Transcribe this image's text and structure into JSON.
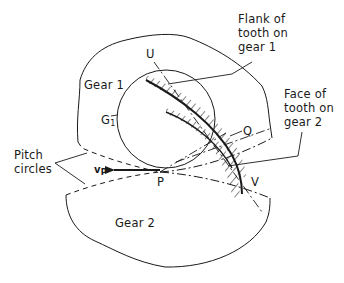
{
  "diagram": {
    "type": "gear-tooth-contact",
    "labels": {
      "gear1": "Gear 1",
      "gear2": "Gear 2",
      "g1_main": "G",
      "g1_sub": "1",
      "point_u": "U",
      "point_q": "Q",
      "point_p": "P",
      "point_v": "V",
      "vp_main": "v",
      "vp_sub": "P",
      "flank_line1": "Flank of",
      "flank_line2": "tooth on",
      "flank_line3": "gear 1",
      "face_line1": "Face of",
      "face_line2": "tooth on",
      "face_line3": "gear 2",
      "pitch_line1": "Pitch",
      "pitch_line2": "circles"
    },
    "colors": {
      "stroke": "#1a1a1a",
      "background": "#ffffff"
    }
  }
}
